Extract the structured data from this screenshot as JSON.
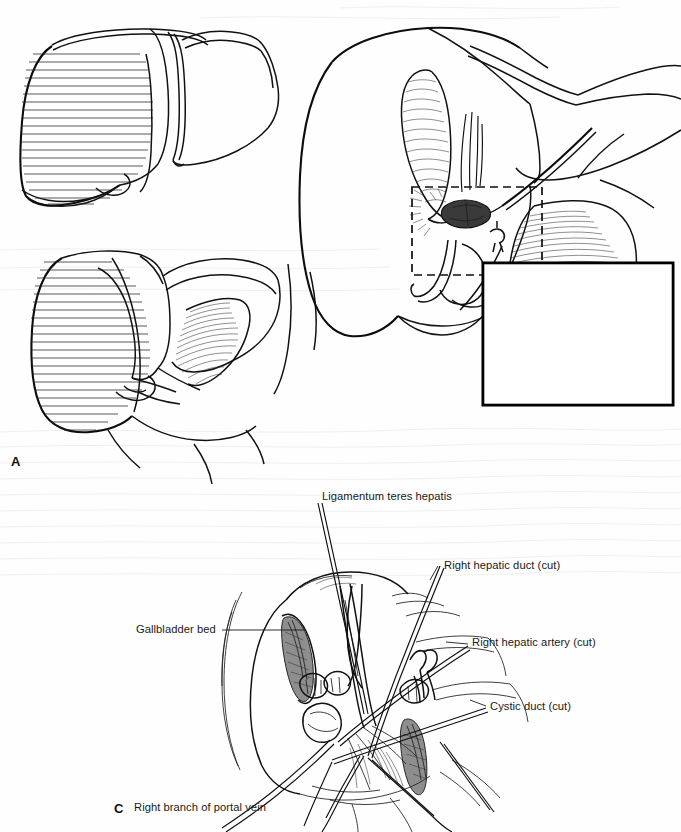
{
  "figure": {
    "kind": "surgical-anatomy-illustration",
    "background_color": "#fefefe",
    "ink_color": "#141414",
    "panels": [
      {
        "id": "A",
        "letter": "A",
        "description": "Two outline views of the liver with the right lobe shown in horizontal line hatching, indicating the resection territory"
      },
      {
        "id": "B",
        "letter": "",
        "description": "Large anterior view of the liver with ligamentum teres retracted, hilar plate opened, dashed rectangle marking the detail region, and a magnified boxed inset of the hilar structures"
      },
      {
        "id": "C",
        "letter": "C",
        "description": "Close view of the operative field after right hepatectomy showing the cut stumps of the hilar structures held by traction sutures"
      }
    ]
  },
  "labels": {
    "ligamentum_teres": "Ligamentum teres hepatis",
    "right_hepatic_duct": "Right hepatic duct (cut)",
    "right_hepatic_artery": "Right hepatic artery (cut)",
    "cystic_duct": "Cystic duct (cut)",
    "gallbladder_bed": "Gallbladder bed",
    "right_branch_portal_vein": "Right branch of portal vein"
  },
  "panel_letters": {
    "a": "A",
    "c": "C"
  }
}
